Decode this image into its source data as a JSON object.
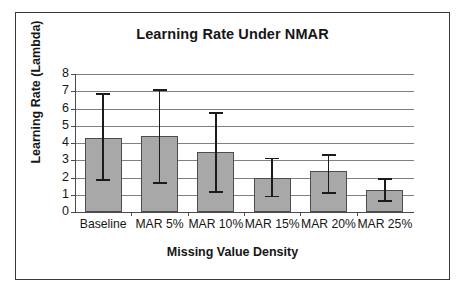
{
  "chart_data": {
    "type": "bar",
    "title": "Learning Rate Under NMAR",
    "xlabel": "Missing Value Density",
    "ylabel": "Learning Rate (Lambda)",
    "categories": [
      "Baseline",
      "MAR 5%",
      "MAR 10%",
      "MAR 15%",
      "MAR 20%",
      "MAR 25%"
    ],
    "values": [
      4.3,
      4.4,
      3.5,
      2.0,
      2.35,
      1.25
    ],
    "error_low": [
      1.85,
      1.7,
      1.15,
      0.9,
      1.1,
      0.65
    ],
    "error_high": [
      6.85,
      7.05,
      5.75,
      3.1,
      3.3,
      1.9
    ],
    "ylim": [
      0,
      8
    ],
    "yticks": [
      0,
      1,
      2,
      3,
      4,
      5,
      6,
      7,
      8
    ],
    "ytick_labels": [
      "0",
      "1",
      "2",
      "3",
      "4",
      "5",
      "6",
      "7",
      "8"
    ],
    "grid": true,
    "legend": null,
    "series": [
      {
        "name": "Learning Rate (Lambda)",
        "values": [
          4.3,
          4.4,
          3.5,
          2.0,
          2.35,
          1.25
        ]
      }
    ],
    "colors": {
      "bar_fill": "#a8a8a8",
      "bar_border": "#4d4d4d",
      "error_bar": "#1b1b1b",
      "gridline": "#808080",
      "axis": "#4a4a4a",
      "text": "#161616",
      "plot_background": "#ffffff",
      "frame_border": "#3a3a3a"
    }
  }
}
